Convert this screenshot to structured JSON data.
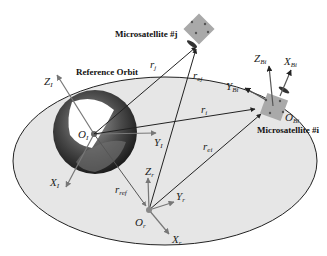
{
  "diagram": {
    "title_labels": {
      "reference_orbit": "Reference Orbit",
      "microsatellite_j": "Microsatellite #j",
      "microsatellite_i": "Microsatellite #i"
    },
    "inertial_frame": {
      "origin": "O",
      "origin_sub": "I",
      "x": "X",
      "x_sub": "I",
      "y": "Y",
      "y_sub": "I",
      "z": "Z",
      "z_sub": "I"
    },
    "reference_frame": {
      "origin": "O",
      "origin_sub": "r",
      "x": "X",
      "x_sub": "r",
      "y": "Y",
      "y_sub": "r",
      "z": "Z",
      "z_sub": "r"
    },
    "body_frame_i": {
      "origin": "O",
      "origin_sub": "Bi",
      "x": "X",
      "x_sub": "Bi",
      "y": "Y",
      "y_sub": "Bi",
      "z": "Z",
      "z_sub": "Bi"
    },
    "vectors": {
      "r_j": "r",
      "r_j_sub": "j",
      "r_ej": "r",
      "r_ej_sub": "ej",
      "r_i": "r",
      "r_i_sub": "i",
      "r_ei": "r",
      "r_ei_sub": "ei",
      "r_ref": "r",
      "r_ref_sub": "ref"
    },
    "colors": {
      "orbit_fill": "#e6e6e6",
      "line": "#222222",
      "axis_gray": "#777777",
      "satellite": "#a9a9a9"
    }
  }
}
